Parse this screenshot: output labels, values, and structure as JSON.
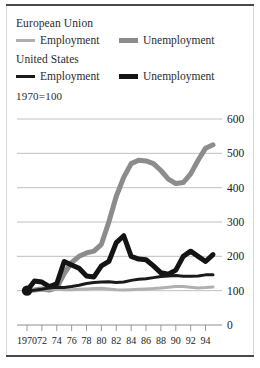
{
  "figure": {
    "index_note": "1970=100"
  },
  "legend": {
    "groups": [
      {
        "name": "European Union",
        "title": "European Union",
        "entries": [
          {
            "label": "Employment",
            "swatch": "eu-employment-line-swatch",
            "color": "#b0b0b0",
            "thickness": 3
          },
          {
            "label": "Unemployment",
            "swatch": "eu-unemployment-line-swatch",
            "color": "#8c8c8c",
            "thickness": 5
          }
        ]
      },
      {
        "name": "United States",
        "title": "United States",
        "entries": [
          {
            "label": "Employment",
            "swatch": "us-employment-line-swatch",
            "color": "#1a1a1a",
            "thickness": 3
          },
          {
            "label": "Unemployment",
            "swatch": "us-unemployment-line-swatch",
            "color": "#141414",
            "thickness": 5
          }
        ]
      }
    ]
  },
  "axes": {
    "y_ticks": [
      "600",
      "500",
      "400",
      "300",
      "200",
      "100",
      "0"
    ],
    "x_ticks": [
      "1970",
      "72",
      "74",
      "76",
      "78",
      "80",
      "82",
      "84",
      "86",
      "88",
      "90",
      "92",
      "94"
    ]
  },
  "chart_data": {
    "type": "line",
    "title": "",
    "subtitle": "",
    "xlabel": "",
    "ylabel": "",
    "index_note": "1970=100",
    "xlim": [
      1970,
      1995
    ],
    "ylim": [
      0,
      600
    ],
    "yticks": [
      0,
      100,
      200,
      300,
      400,
      500,
      600
    ],
    "xticks": [
      1970,
      1972,
      1974,
      1976,
      1978,
      1980,
      1982,
      1984,
      1986,
      1988,
      1990,
      1992,
      1994
    ],
    "grid": "horizontal",
    "legend_position": "above-plot",
    "origin_marker": {
      "x": 1970,
      "y": 100,
      "label": "1970=100 index base point",
      "color": "#141414"
    },
    "x": [
      1970,
      1971,
      1972,
      1973,
      1974,
      1975,
      1976,
      1977,
      1978,
      1979,
      1980,
      1981,
      1982,
      1983,
      1984,
      1985,
      1986,
      1987,
      1988,
      1989,
      1990,
      1991,
      1992,
      1993,
      1994,
      1995
    ],
    "series": [
      {
        "name": "European Union Unemployment",
        "region": "European Union",
        "measure": "Unemployment",
        "color": "#8c8c8c",
        "thickness": 5,
        "values": [
          100,
          102,
          105,
          102,
          108,
          150,
          182,
          200,
          210,
          215,
          235,
          300,
          375,
          430,
          470,
          480,
          478,
          470,
          450,
          425,
          412,
          415,
          440,
          480,
          515,
          525
        ]
      },
      {
        "name": "European Union Employment",
        "region": "European Union",
        "measure": "Employment",
        "color": "#b0b0b0",
        "thickness": 3,
        "values": [
          100,
          101,
          102,
          104,
          105,
          103,
          103,
          104,
          105,
          106,
          107,
          105,
          103,
          102,
          103,
          104,
          105,
          106,
          108,
          110,
          112,
          112,
          110,
          108,
          109,
          111
        ]
      },
      {
        "name": "United States Unemployment",
        "region": "United States",
        "measure": "Unemployment",
        "color": "#141414",
        "thickness": 5,
        "values": [
          100,
          128,
          125,
          112,
          120,
          185,
          175,
          165,
          143,
          140,
          172,
          185,
          240,
          260,
          200,
          192,
          190,
          172,
          152,
          148,
          160,
          200,
          215,
          200,
          185,
          205
        ]
      },
      {
        "name": "United States Employment",
        "region": "United States",
        "measure": "Employment",
        "color": "#1a1a1a",
        "thickness": 3,
        "values": [
          100,
          101,
          104,
          108,
          110,
          109,
          112,
          116,
          121,
          124,
          125,
          126,
          124,
          125,
          130,
          133,
          135,
          138,
          141,
          143,
          144,
          142,
          142,
          143,
          146,
          146
        ]
      }
    ]
  }
}
